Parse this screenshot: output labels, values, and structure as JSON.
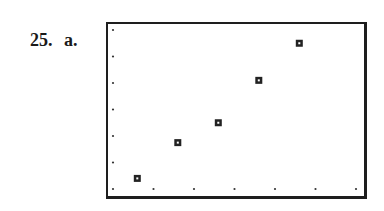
{
  "problem": {
    "number": "25.",
    "part": "a."
  },
  "chart_data": {
    "type": "scatter",
    "title": "",
    "xlabel": "",
    "ylabel": "",
    "grid": "dot-ticks",
    "tick_dots": {
      "x_count": 7,
      "y_count": 7
    },
    "xlim": [
      0,
      6
    ],
    "ylim": [
      0,
      6
    ],
    "x": [
      0.6,
      1.6,
      2.6,
      3.6,
      4.6
    ],
    "y": [
      0.4,
      1.75,
      2.5,
      4.1,
      5.5
    ],
    "marker": "square",
    "marker_color": "#222222",
    "frame_color": "#1e1e1e"
  }
}
